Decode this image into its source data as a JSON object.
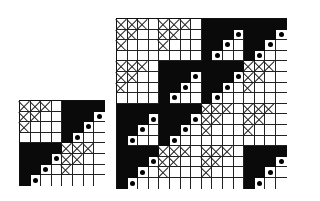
{
  "figure": {
    "legend": {
      "X": "crossed cell",
      "B": "black cell",
      "D": "white cell with black dot",
      "W": "white cell"
    },
    "block_types": {
      "X": [
        [
          "X",
          "X",
          "X",
          "W"
        ],
        [
          "X",
          "X",
          "W",
          "W"
        ],
        [
          "X",
          "W",
          "W",
          "W"
        ],
        [
          "W",
          "W",
          "W",
          "W"
        ]
      ],
      "B": [
        [
          "B",
          "B",
          "B",
          "B"
        ],
        [
          "B",
          "B",
          "B",
          "D"
        ],
        [
          "B",
          "B",
          "D",
          "W"
        ],
        [
          "B",
          "D",
          "W",
          "W"
        ]
      ]
    },
    "small_grid": {
      "size": 8,
      "position": {
        "left": 19,
        "top": 100
      },
      "cell_px": 10.6,
      "blocks": [
        [
          "X",
          "B"
        ],
        [
          "B",
          "X"
        ]
      ]
    },
    "large_grid": {
      "size": 16,
      "position": {
        "left": 116,
        "top": 18
      },
      "cell_px": 10.6,
      "blocks": [
        [
          "X",
          "X",
          "B",
          "B"
        ],
        [
          "X",
          "B",
          "B",
          "X"
        ],
        [
          "B",
          "B",
          "X",
          "X"
        ],
        [
          "B",
          "X",
          "X",
          "B"
        ]
      ]
    }
  }
}
